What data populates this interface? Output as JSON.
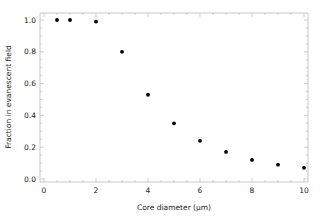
{
  "chart_data": {
    "type": "scatter",
    "title": "",
    "xlabel": "Core diameter (μm)",
    "ylabel": "Fraction in evanescent field",
    "xlim": [
      -0.15,
      10.2
    ],
    "ylim": [
      -0.02,
      1.04
    ],
    "x_ticks": [
      "0",
      "2",
      "4",
      "6",
      "8",
      "10"
    ],
    "y_ticks": [
      "0.0",
      "0.2",
      "0.4",
      "0.6",
      "0.8",
      "1.0"
    ],
    "grid": false,
    "legend": null,
    "marker_color": "#000000",
    "series": [
      {
        "name": "fraction",
        "x": [
          0.5,
          1,
          2,
          3,
          4,
          5,
          6,
          7,
          8,
          9,
          10
        ],
        "y": [
          1.0,
          1.0,
          0.99,
          0.8,
          0.53,
          0.35,
          0.24,
          0.17,
          0.12,
          0.09,
          0.07
        ]
      }
    ]
  }
}
